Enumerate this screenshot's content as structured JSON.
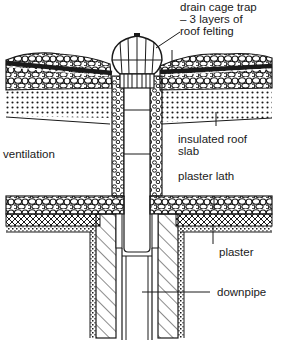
{
  "diagram": {
    "type": "architectural cross-section",
    "labels": {
      "drain_cage_trap": "drain cage trap",
      "roof_felting_1": "– 3 layers of",
      "roof_felting_2": "roof felting",
      "ventilation": "ventilation",
      "insulated_roof_1": "insulated roof",
      "insulated_roof_2": "slab",
      "plaster_lath": "plaster lath",
      "plaster": "plaster",
      "downpipe": "downpipe"
    },
    "colors": {
      "ink": "#1a1a1a",
      "paper": "#ffffff"
    }
  }
}
